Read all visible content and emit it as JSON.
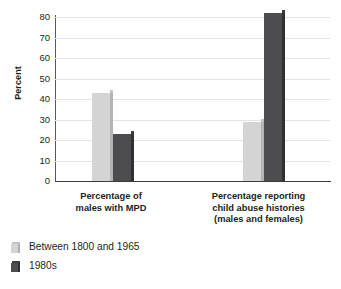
{
  "chart_data": {
    "type": "bar",
    "title": "",
    "xlabel": "",
    "ylabel": "Percent",
    "ylim": [
      0,
      80
    ],
    "ytick_values": [
      80,
      70,
      60,
      50,
      40,
      30,
      20,
      10,
      0
    ],
    "ytick_labels": [
      "80",
      "70",
      "60",
      "50",
      "40",
      "30",
      "20",
      "10",
      "0"
    ],
    "grid": true,
    "legend_position": "below-left",
    "categories": [
      "Percentage of males with MPD",
      "Percentage reporting child abuse histories (males and females)"
    ],
    "category_lines": [
      [
        "Percentage of",
        "males with MPD"
      ],
      [
        "Percentage reporting",
        "child abuse histories",
        "(males and females)"
      ]
    ],
    "series": [
      {
        "name": "Between 1800 and 1965",
        "color": "#d4d4d4",
        "values": [
          43,
          29
        ]
      },
      {
        "name": "1980s",
        "color": "#4d4d4f",
        "values": [
          23,
          82
        ]
      }
    ]
  },
  "axis": {
    "y_title": "Percent"
  },
  "legend": {
    "items": [
      {
        "label": "Between 1800 and 1965",
        "swatch": "light"
      },
      {
        "label": "1980s",
        "swatch": "dark"
      }
    ]
  }
}
